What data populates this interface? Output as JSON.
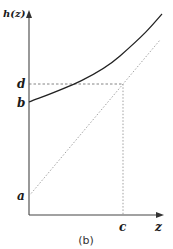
{
  "diagram": {
    "y_axis_label": "h(z)",
    "x_axis_label": "z",
    "y_ticks": [
      {
        "label": "d",
        "y": 84
      },
      {
        "label": "b",
        "y": 102
      },
      {
        "label": "a",
        "y": 196
      }
    ],
    "x_ticks": [
      {
        "label": "c",
        "x": 123
      }
    ],
    "caption": "(b)",
    "elements": [
      {
        "type": "curve",
        "style": "solid",
        "description": "convex increasing curve h(z) starting at b"
      },
      {
        "type": "line",
        "style": "dotted",
        "description": "straight line starting at a, crossing curve level d at z=c"
      },
      {
        "type": "guide",
        "style": "dashed",
        "description": "horizontal from d to intersection point"
      },
      {
        "type": "guide",
        "style": "dotted",
        "description": "vertical from intersection down to c"
      }
    ],
    "colors": {
      "axis": "#333333",
      "curve": "#222222",
      "dotted": "#888888",
      "text": "#1a1a1a"
    }
  }
}
